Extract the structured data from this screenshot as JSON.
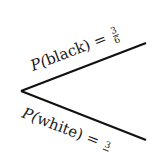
{
  "diagram": {
    "type": "probability-tree",
    "branches": [
      {
        "name": "black",
        "label_prefix": "P(",
        "outcome": "black",
        "label_suffix": ") =",
        "numerator": "3",
        "denominator": "6"
      },
      {
        "name": "white",
        "label_prefix": "P(",
        "outcome": "white",
        "label_suffix": ") =",
        "numerator": "3",
        "denominator": ""
      }
    ],
    "line_color": "#111111"
  }
}
